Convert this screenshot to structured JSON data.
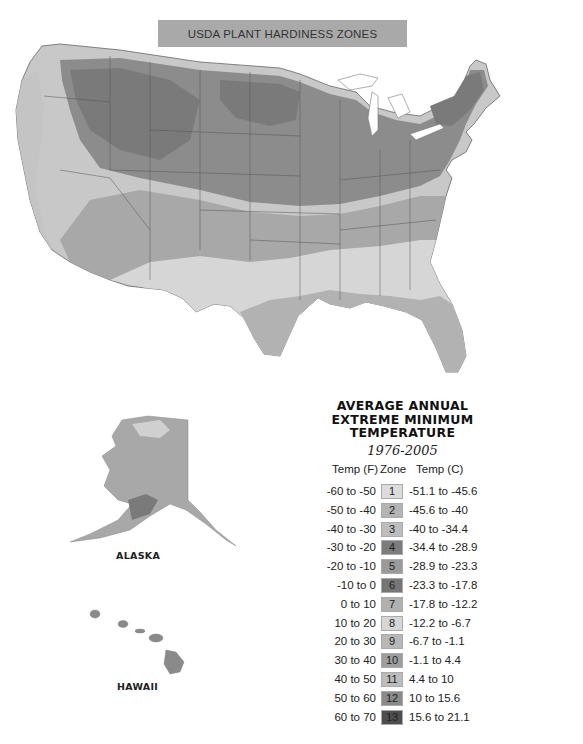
{
  "header": {
    "title": "USDA PLANT HARDINESS ZONES"
  },
  "map": {
    "region": "Contiguous United States",
    "insets": [
      {
        "name": "alaska",
        "label": "ALASKA"
      },
      {
        "name": "hawaii",
        "label": "HAWAII"
      }
    ],
    "colors": {
      "background": "#ffffff",
      "banner": "#a9a9a9",
      "state_border": "#555555"
    }
  },
  "legend": {
    "title_lines": [
      "AVERAGE ANNUAL",
      "EXTREME MINIMUM",
      "TEMPERATURE"
    ],
    "period": "1976-2005",
    "columns": {
      "temp_f": "Temp (F)",
      "zone": "Zone",
      "temp_c": "Temp (C)"
    },
    "rows": [
      {
        "temp_f": "-60 to -50",
        "zone": "1",
        "temp_c": "-51.1 to -45.6",
        "color": "#dcdcdc"
      },
      {
        "temp_f": "-50 to -40",
        "zone": "2",
        "temp_c": "-45.6 to -40",
        "color": "#b4b4b4"
      },
      {
        "temp_f": "-40 to -30",
        "zone": "3",
        "temp_c": "-40 to -34.4",
        "color": "#bdbdbd"
      },
      {
        "temp_f": "-30 to -20",
        "zone": "4",
        "temp_c": "-34.4 to -28.9",
        "color": "#7c7c7c"
      },
      {
        "temp_f": "-20 to -10",
        "zone": "5",
        "temp_c": "-28.9 to -23.3",
        "color": "#9a9a9a"
      },
      {
        "temp_f": "-10 to 0",
        "zone": "6",
        "temp_c": "-23.3 to -17.8",
        "color": "#767676"
      },
      {
        "temp_f": "0 to 10",
        "zone": "7",
        "temp_c": "-17.8 to -12.2",
        "color": "#b0b0b0"
      },
      {
        "temp_f": "10 to 20",
        "zone": "8",
        "temp_c": "-12.2 to -6.7",
        "color": "#d6d6d6"
      },
      {
        "temp_f": "20 to 30",
        "zone": "9",
        "temp_c": "-6.7 to -1.1",
        "color": "#b8b8b8"
      },
      {
        "temp_f": "30 to 40",
        "zone": "10",
        "temp_c": "-1.1 to 4.4",
        "color": "#9e9e9e"
      },
      {
        "temp_f": "40 to 50",
        "zone": "11",
        "temp_c": "4.4 to 10",
        "color": "#bcbcbc"
      },
      {
        "temp_f": "50 to 60",
        "zone": "12",
        "temp_c": "10 to 15.6",
        "color": "#8a8a8a"
      },
      {
        "temp_f": "60 to 70",
        "zone": "13",
        "temp_c": "15.6 to 21.1",
        "color": "#4e4e4e"
      }
    ]
  }
}
